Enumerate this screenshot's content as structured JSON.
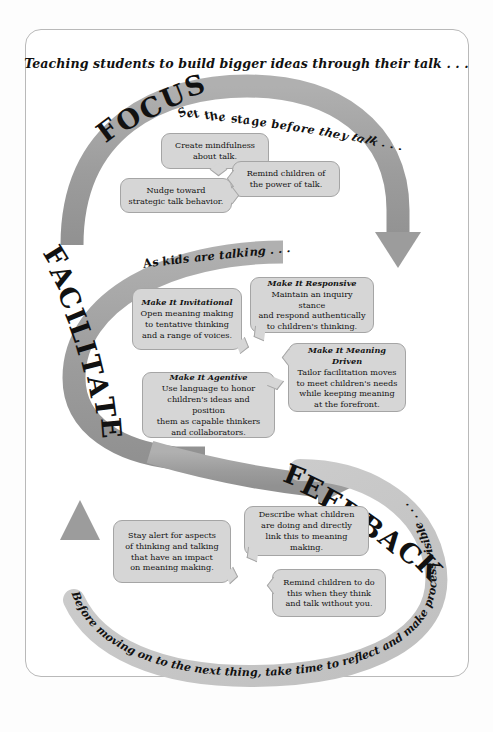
{
  "headline": "Teaching students to build bigger ideas through their talk . . .",
  "sections": [
    {
      "key": "focus",
      "title": "FOCUS",
      "subtitle": "Set the stage before they talk . . .",
      "boxes": [
        {
          "header": "",
          "body": "Create mindfulness about talk."
        },
        {
          "header": "",
          "body": "Remind children of the power of talk."
        },
        {
          "header": "",
          "body": "Nudge toward strategic talk behavior."
        }
      ]
    },
    {
      "key": "facilitate",
      "title": "FACILITATE",
      "subtitle": "As kids are talking . . .",
      "boxes": [
        {
          "header": "Make It Invitational",
          "body": "Open meaning making to tentative thinking and a range of voices."
        },
        {
          "header": "Make It Responsive",
          "body": "Maintain an inquiry stance and respond authentically to children's thinking."
        },
        {
          "header": "Make It Meaning Driven",
          "body": "Tailor facilitation moves to meet children's needs while keeping meaning at the forefront."
        },
        {
          "header": "Make It Agentive",
          "body": "Use language to honor children's ideas and position them as capable thinkers and collaborators."
        }
      ]
    },
    {
      "key": "feedback",
      "title": "FEEDBACK",
      "subtitle": "Before moving on to the next thing, take time to reflect and make process visible . . .",
      "boxes": [
        {
          "header": "",
          "body": "Stay alert for aspects of thinking and talking that have an impact on meaning making."
        },
        {
          "header": "",
          "body": "Describe what children are doing and directly link this to meaning making."
        },
        {
          "header": "",
          "body": "Remind children to do this when they think and talk without you."
        }
      ]
    }
  ],
  "box_text": {
    "focus_1_l1": "Create mindfulness",
    "focus_1_l2": "about talk.",
    "focus_2_l1": "Remind children of",
    "focus_2_l2": "the power of talk.",
    "focus_3_l1": "Nudge toward",
    "focus_3_l2": "strategic talk behavior.",
    "fac_invit_hdr": "Make It Invitational",
    "fac_invit_l1": "Open meaning making",
    "fac_invit_l2": "to tentative thinking",
    "fac_invit_l3": "and a range of voices.",
    "fac_resp_hdr": "Make It Responsive",
    "fac_resp_l1": "Maintain an inquiry stance",
    "fac_resp_l2": "and respond authentically",
    "fac_resp_l3": "to children's thinking.",
    "fac_mean_hdr": "Make It Meaning Driven",
    "fac_mean_l1": "Tailor facilitation moves",
    "fac_mean_l2": "to meet children's needs",
    "fac_mean_l3": "while keeping meaning",
    "fac_mean_l4": "at the forefront.",
    "fac_agent_hdr": "Make It Agentive",
    "fac_agent_l1": "Use language to honor",
    "fac_agent_l2": "children's ideas and position",
    "fac_agent_l3": "them as capable thinkers",
    "fac_agent_l4": "and collaborators.",
    "fb_stay_l1": "Stay alert for aspects",
    "fb_stay_l2": "of thinking and talking",
    "fb_stay_l3": "that have an impact",
    "fb_stay_l4": "on meaning making.",
    "fb_desc_l1": "Describe what children",
    "fb_desc_l2": "are doing and directly",
    "fb_desc_l3": "link this to meaning making.",
    "fb_rem_l1": "Remind children to do",
    "fb_rem_l2": "this when they think",
    "fb_rem_l3": "and talk without you."
  },
  "colors": {
    "arrow_dark": "#9a9a9a",
    "arrow_light": "#c6c6c6",
    "box_fill": "#d6d6d6",
    "box_border": "#a5a5a5",
    "text": "#111111",
    "page_border": "#b9b9b9",
    "background": "#ffffff"
  }
}
